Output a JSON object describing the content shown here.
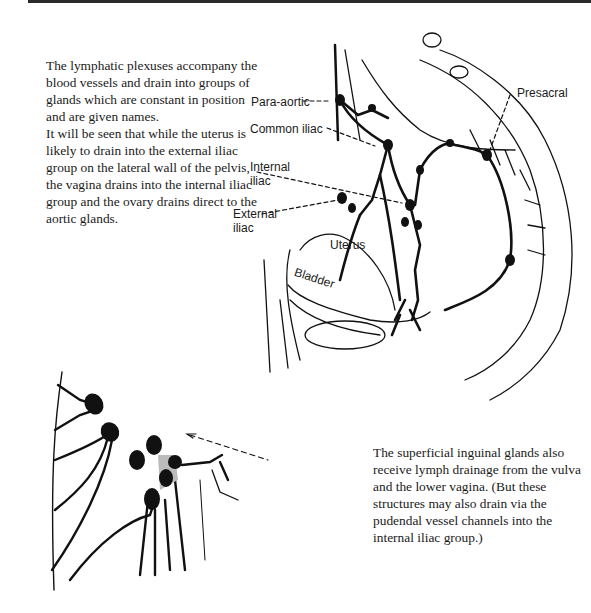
{
  "page": {
    "paragraphs": [
      "The lymphatic plexuses accompany the blood vessels and drain into groups of glands which are constant in position and are given names.",
      "It will be seen that while the uterus is likely to drain into the external iliac group on the lateral wall of the pelvis, the vagina drains into the internal iliac group and the ovary drains direct to the aortic glands.",
      "The superficial inguinal glands also receive lymph drainage from the vulva and the lower vagina. (But these structures may also drain via the pudendal vessel channels into the internal iliac group.)"
    ]
  },
  "pelvis_figure": {
    "labels": {
      "para_aortic": "Para-aortic",
      "presacral": "Presacral",
      "common_iliac": "Common iliac",
      "internal_iliac_1": "Internal",
      "internal_iliac_2": "iliac",
      "external_iliac_1": "External",
      "external_iliac_2": "iliac",
      "uterus": "Uterus",
      "bladder": "Bladder"
    }
  },
  "inguinal_figure": {
    "description": "superficial inguinal glands"
  }
}
